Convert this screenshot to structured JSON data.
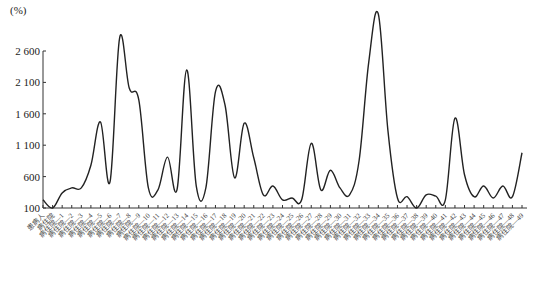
{
  "chart_data": {
    "type": "line",
    "title": "",
    "xlabel": "",
    "ylabel": "(%)",
    "ylim": [
      100,
      2600
    ],
    "yticks": [
      100,
      600,
      1100,
      1600,
      2100,
      2600
    ],
    "ytick_labels": [
      "100",
      "600",
      "1 100",
      "1 600",
      "2 100",
      "2 600"
    ],
    "grid": false,
    "legend": null,
    "line_color": "#222222",
    "smooth": true,
    "categories": [
      "患病人",
      "病住院",
      "病住院—1",
      "病住院—2",
      "病住院—3",
      "病住院—4",
      "病住院—5",
      "病住院—6",
      "病住院—7",
      "病住院—8",
      "病住院—9",
      "病住院—10",
      "病住院—11",
      "病住院—12",
      "病住院—13",
      "病住院—14",
      "病住院—15",
      "病住院—16",
      "病住院—17",
      "病住院—18",
      "病住院—19",
      "病住院—20",
      "病住院—21",
      "病住院—22",
      "病住院—23",
      "病住院—24",
      "病住院—25",
      "病住院—26",
      "病住院—27",
      "病住院—28",
      "病住院—29",
      "病住院—30",
      "病住院—31",
      "病住院—32",
      "病住院—33",
      "病住院—34",
      "病住院—35",
      "病住院—36",
      "病住院—37",
      "病住院—38",
      "病住院—39",
      "病住院—40",
      "病住院—41",
      "病住院—42",
      "病住院—43",
      "病住院—44",
      "病住院—45",
      "病住院—46",
      "病住院—47",
      "病住院—48",
      "病住院—49"
    ],
    "series": [
      {
        "name": "series-1",
        "values": [
          230,
          100,
          340,
          420,
          420,
          780,
          1470,
          520,
          2810,
          2010,
          1820,
          420,
          390,
          910,
          400,
          2300,
          450,
          420,
          1950,
          1740,
          580,
          1450,
          900,
          310,
          450,
          230,
          260,
          230,
          1130,
          390,
          700,
          420,
          310,
          860,
          2420,
          3190,
          1340,
          260,
          280,
          100,
          310,
          290,
          230,
          1530,
          630,
          280,
          450,
          260,
          450,
          280,
          980
        ]
      }
    ]
  },
  "axis": {
    "unit_label": "(%)"
  }
}
